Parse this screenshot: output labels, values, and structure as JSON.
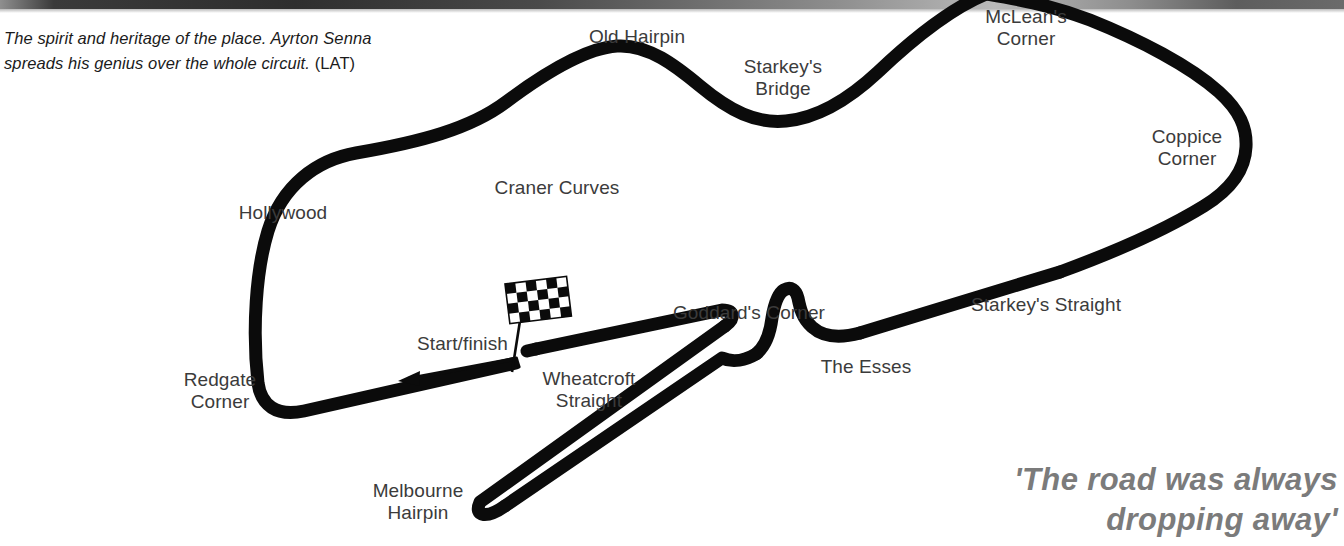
{
  "page": {
    "background_color": "#ffffff"
  },
  "top_rule": {
    "name": "decorative-top-rule",
    "colors": [
      "#8f8f8f",
      "#2e2e2e",
      "#b9b9b9",
      "#5d5d5d"
    ]
  },
  "caption": {
    "text": "The spirit and heritage of the place. Ayrton Senna spreads his genius over the whole circuit. ",
    "credit": "(LAT)",
    "color": "#1b1b1b"
  },
  "pullquote": {
    "line1": "'The road was always",
    "line2": "dropping away'",
    "color": "#7b7b7b"
  },
  "map": {
    "track_color": "#0b0b0b",
    "label_color": "#3b3b3b",
    "start_finish_label": "Start/finish",
    "flag": {
      "name": "checkered-flag",
      "columns": 6,
      "rows": 4,
      "colors": [
        "#0b0b0b",
        "#ffffff"
      ]
    },
    "labels": [
      {
        "id": "old-hairpin",
        "text": "Old Hairpin",
        "x": 637,
        "y": 28,
        "align": "center"
      },
      {
        "id": "starkeys-bridge",
        "text": "Starkey's\nBridge",
        "x": 783,
        "y": 58,
        "align": "center"
      },
      {
        "id": "mcleans-corner",
        "text": "McLean's\nCorner",
        "x": 1026,
        "y": 8,
        "align": "center"
      },
      {
        "id": "coppice-corner",
        "text": "Coppice\nCorner",
        "x": 1187,
        "y": 128,
        "align": "center"
      },
      {
        "id": "craner-curves",
        "text": "Craner Curves",
        "x": 557,
        "y": 179,
        "align": "center"
      },
      {
        "id": "hollywood",
        "text": "Hollywood",
        "x": 283,
        "y": 204,
        "align": "center"
      },
      {
        "id": "starkeys-straight",
        "text": "Starkey's Straight",
        "x": 1046,
        "y": 296,
        "align": "center"
      },
      {
        "id": "goddards-corner",
        "text": "Goddard's Corner",
        "x": 749,
        "y": 304,
        "align": "center"
      },
      {
        "id": "the-esses",
        "text": "The Esses",
        "x": 866,
        "y": 358,
        "align": "center"
      },
      {
        "id": "redgate-corner",
        "text": "Redgate\nCorner",
        "x": 220,
        "y": 371,
        "align": "center"
      },
      {
        "id": "wheatcroft-straight",
        "text": "Wheatcroft\nStraight",
        "x": 589,
        "y": 370,
        "align": "center"
      },
      {
        "id": "melbourne-hairpin",
        "text": "Melbourne\nHairpin",
        "x": 418,
        "y": 482,
        "align": "center"
      }
    ]
  }
}
